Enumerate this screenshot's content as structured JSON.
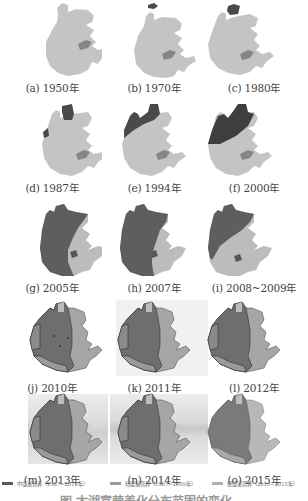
{
  "figure": {
    "colors": {
      "moderate_eutrophic": "#6e6e6e",
      "light_eutrophic_early": "#bdbdbd",
      "light_eutrophic_late": "#a8a8a8",
      "lake_base": "#c4c4c4",
      "inner_patch": "#8a8a8a",
      "dark_patch": "#4a4a4a"
    },
    "panels": [
      {
        "id": "a",
        "label": "(a) 1950年"
      },
      {
        "id": "b",
        "label": "(b) 1970年"
      },
      {
        "id": "c",
        "label": "(c) 1980年"
      },
      {
        "id": "d",
        "label": "(d) 1987年"
      },
      {
        "id": "e",
        "label": "(e) 1994年"
      },
      {
        "id": "f",
        "label": "(f) 2000年"
      },
      {
        "id": "g",
        "label": "(g) 2005年"
      },
      {
        "id": "h",
        "label": "(h) 2007年"
      },
      {
        "id": "i",
        "label": "(i) 2008~2009年"
      },
      {
        "id": "j",
        "label": "(j) 2010年"
      },
      {
        "id": "k",
        "label": "(k) 2011年"
      },
      {
        "id": "l",
        "label": "(l) 2012年"
      },
      {
        "id": "m",
        "label": "(m) 2013年"
      },
      {
        "id": "n",
        "label": "(n) 2014年"
      },
      {
        "id": "o",
        "label": "(o) 2015年"
      }
    ],
    "legend": [
      {
        "label": "中度富营养（1987~2015年）",
        "color": "#5a5a5a"
      },
      {
        "label": "轻度富营养（1987~2009年）",
        "color": "#9a9a9a"
      },
      {
        "label": "轻度富营养（2010~2015年）",
        "color": "#b0b0b0"
      }
    ],
    "caption": "图  太湖富营养化分布范围的变化"
  }
}
